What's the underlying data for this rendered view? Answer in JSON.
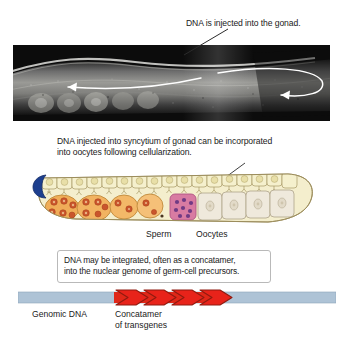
{
  "figure": {
    "title_caption": "DNA is injected into the gonad.",
    "mid_caption": "DNA injected into syncytium of gonad can be incorporated\ninto oocytes following cellularization.",
    "boxed_note": "DNA may be integrated, often as a concatamer,\ninto the nuclear genome of germ-cell precursors.",
    "labels": {
      "sperm": "Sperm",
      "oocytes": "Oocytes",
      "genomic_dna": "Genomic DNA",
      "concatamer": "Concatamer\nof transgenes"
    },
    "icons": {
      "micrograph": "worm-micrograph-image",
      "leader_line_top": "leader-line-icon",
      "leader_line_mid": "leader-arrow-icon",
      "flow_arrow_left": "curved-arrow-left-icon",
      "flow_arrow_loop": "curved-arrow-loop-icon",
      "gonad": "gonad-diagram-icon",
      "distal_cap": "distal-tip-cap-icon",
      "dna_bar": "genomic-dna-bar-icon",
      "transgene_arrows": "transgene-arrow-icon"
    },
    "colors": {
      "text": "#1a1a1a",
      "box_border": "#b9b9b9",
      "dna_bar_blue": "#aec3d6",
      "dna_bar_red": "#e02718",
      "arrow_red_fill": "#e8231a",
      "arrow_red_stroke": "#8f1b10",
      "syncytium_cream": "#f2ecc4",
      "germ_cell_orange": "#f0a94e",
      "nucleus_rust": "#c0502a",
      "sperm_pink": "#d9799f",
      "sperm_nucleus": "#7b3f86",
      "oocyte_cream": "#efe9dc",
      "distal_cap_blue": "#1d3f8f",
      "outline": "#8a7a4e"
    },
    "transgene_arrow_count": 4
  }
}
